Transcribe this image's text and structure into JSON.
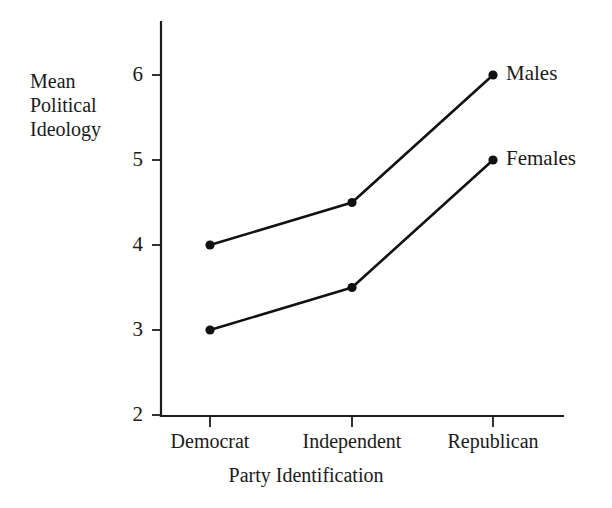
{
  "chart_data": {
    "type": "line",
    "title": "",
    "xlabel": "Party Identification",
    "ylabel": "Mean Political Ideology",
    "categories": [
      "Democrat",
      "Independent",
      "Republican"
    ],
    "series": [
      {
        "name": "Males",
        "values": [
          4.0,
          4.5,
          6.0
        ]
      },
      {
        "name": "Females",
        "values": [
          3.0,
          3.5,
          5.0
        ]
      }
    ],
    "ylim": [
      2,
      6
    ],
    "yticks": [
      2,
      3,
      4,
      5,
      6
    ],
    "ytick_labels": [
      "2",
      "3",
      "4",
      "5",
      "6"
    ],
    "grid": false,
    "legend_position": "inline-right-of-last-point",
    "line_color": "#111111",
    "marker": "filled-circle",
    "background_color": "#ffffff"
  },
  "axes": {
    "y_title_lines": [
      "Mean",
      "Political",
      "Ideology"
    ],
    "y_title_line_1": "Mean",
    "y_title_line_2": "Political",
    "y_title_line_3": "Ideology",
    "x_title": "Party Identification",
    "y_labels": {
      "t6": "6",
      "t5": "5",
      "t4": "4",
      "t3": "3",
      "t2": "2"
    },
    "x_labels": {
      "c0": "Democrat",
      "c1": "Independent",
      "c2": "Republican"
    }
  },
  "legend": {
    "males": "Males",
    "females": "Females"
  }
}
